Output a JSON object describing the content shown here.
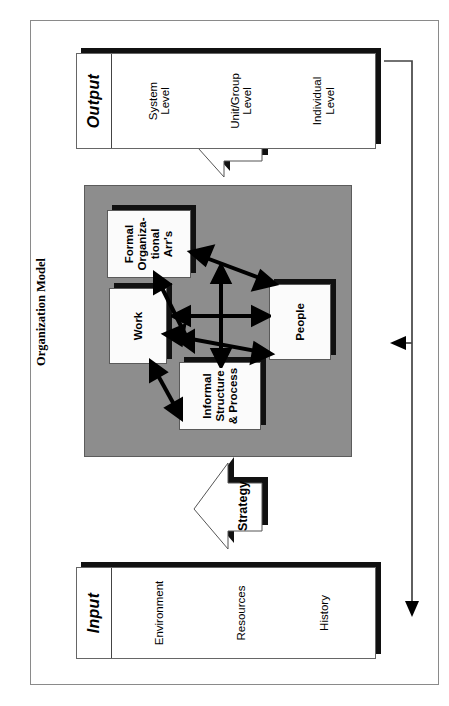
{
  "document": {
    "title": "Organization Model"
  },
  "colors": {
    "page_background": "#ffffff",
    "frame_border": "#8a8a8a",
    "panel_fill": "#8d8d8d",
    "box_fill": "#fbfbfb",
    "shadow": "#111111",
    "line": "#000000"
  },
  "input": {
    "heading": "Input",
    "items": [
      {
        "label": "Environment"
      },
      {
        "label": "Resources"
      },
      {
        "label": "History"
      }
    ]
  },
  "output": {
    "heading": "Output",
    "items": [
      {
        "label": "System\nLevel"
      },
      {
        "label": "Unit/Group\nLevel"
      },
      {
        "label": "Individual\nLevel"
      }
    ]
  },
  "transformation": {
    "components": [
      {
        "key": "formal",
        "label": "Formal\nOrganiza-\ntional\nArr's"
      },
      {
        "key": "informal",
        "label": "Informal\nStructure\n& Process"
      },
      {
        "key": "work",
        "label": "Work"
      },
      {
        "key": "people",
        "label": "People"
      }
    ]
  },
  "arrows": {
    "strategy_label": "Strategy",
    "output_arrow_label": ""
  }
}
